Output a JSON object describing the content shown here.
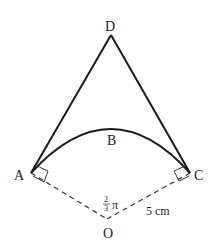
{
  "diagram": {
    "points": {
      "D": {
        "label": "D",
        "x": 111,
        "y": 35
      },
      "A": {
        "label": "A",
        "x": 31,
        "y": 173
      },
      "C": {
        "label": "C",
        "x": 190,
        "y": 173
      },
      "O": {
        "label": "O",
        "x": 107,
        "y": 220
      },
      "B": {
        "label": "B"
      }
    },
    "angle_label": {
      "numerator": "2",
      "denominator": "3",
      "symbol": "π"
    },
    "radius_label": "5 cm",
    "colors": {
      "stroke": "#1a1a1a",
      "dashed": "#333333",
      "text": "#222222"
    }
  }
}
